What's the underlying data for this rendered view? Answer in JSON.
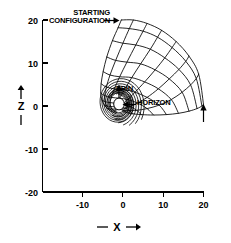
{
  "figure": {
    "annotations": {
      "starting_configuration_line1": "STARTING",
      "starting_configuration_line2": "CONFIGURATION",
      "spin": "SPIN",
      "horizon": "HORIZON"
    },
    "axes": {
      "x_label": "X",
      "z_label": "Z",
      "x_label_prefix": "—",
      "x_label_suffix": "→"
    },
    "colors": {
      "line": "#000000",
      "background": "#ffffff"
    }
  },
  "chart_data": {
    "type": "line",
    "title": "",
    "xlabel": "X",
    "ylabel": "Z",
    "xlim": [
      -18,
      20
    ],
    "ylim": [
      -20,
      20
    ],
    "grid": false,
    "legend": "none",
    "xticks": [
      -10,
      0,
      10,
      20
    ],
    "xticklabels": [
      "-10",
      "0",
      "10",
      "20"
    ],
    "yticks": [
      20,
      10,
      0,
      -10,
      -20
    ],
    "yticklabels": [
      "20",
      "10",
      "0",
      "-10",
      "-20"
    ],
    "horizon": {
      "center_x": -1.0,
      "center_z": 0.6,
      "radius_x": 1.3,
      "radius_z": 1.5
    },
    "spin_arrow": {
      "x": -1.0,
      "z_from": 1.6,
      "z_to": 5.2,
      "direction": "up"
    },
    "right_edge_arrow": {
      "x": 20.0,
      "z_from": -3.6,
      "z_to": 0.4,
      "direction": "up"
    },
    "starting_configuration_arrow": {
      "to_x": -0.4,
      "to_z": 20.0
    },
    "horizon_arrow": {
      "to_x": 0.6,
      "to_z": 0.4
    },
    "series": [
      {
        "name": "radial-spiral-1",
        "role": "mesh-radial",
        "x": [
          -0.4,
          -1.2,
          -2.6,
          -4.0,
          -4.9,
          -5.4,
          -5.5,
          -5.2,
          -4.6,
          -3.8,
          -3.0,
          -2.3,
          -1.8,
          -1.5
        ],
        "z": [
          20.0,
          18.2,
          15.2,
          11.4,
          8.0,
          5.2,
          3.0,
          1.4,
          0.2,
          -0.6,
          -1.2,
          -1.5,
          -1.6,
          -1.4
        ]
      },
      {
        "name": "radial-spiral-2",
        "role": "mesh-radial",
        "x": [
          2.6,
          1.6,
          0.0,
          -1.8,
          -3.2,
          -4.1,
          -4.5,
          -4.4,
          -4.0,
          -3.3,
          -2.6,
          -2.0,
          -1.7
        ],
        "z": [
          20.0,
          18.0,
          14.6,
          10.6,
          7.2,
          4.4,
          2.4,
          1.0,
          0.0,
          -0.7,
          -1.1,
          -1.3,
          -1.3
        ]
      },
      {
        "name": "radial-spiral-3",
        "role": "mesh-radial",
        "x": [
          6.0,
          5.0,
          3.2,
          1.0,
          -0.8,
          -2.1,
          -2.9,
          -3.2,
          -3.1,
          -2.7,
          -2.2,
          -1.8
        ],
        "z": [
          19.2,
          17.4,
          14.2,
          10.2,
          6.8,
          4.0,
          2.0,
          0.8,
          -0.1,
          -0.7,
          -1.0,
          -1.1
        ]
      },
      {
        "name": "radial-spiral-4",
        "role": "mesh-radial",
        "x": [
          9.6,
          8.6,
          6.8,
          4.4,
          2.2,
          0.4,
          -0.8,
          -1.6,
          -1.9,
          -1.9,
          -1.7,
          -1.5
        ],
        "z": [
          17.6,
          16.0,
          13.2,
          9.8,
          6.6,
          3.8,
          1.8,
          0.6,
          -0.2,
          -0.7,
          -0.9,
          -0.9
        ]
      },
      {
        "name": "radial-spiral-5",
        "role": "mesh-radial",
        "x": [
          13.2,
          12.2,
          10.4,
          8.0,
          5.4,
          3.0,
          1.2,
          0.0,
          -0.7,
          -1.0,
          -1.1
        ],
        "z": [
          15.0,
          13.6,
          11.2,
          8.4,
          5.6,
          3.2,
          1.5,
          0.4,
          -0.3,
          -0.6,
          -0.7
        ]
      },
      {
        "name": "radial-spiral-6",
        "role": "mesh-radial",
        "x": [
          16.4,
          15.6,
          13.9,
          11.5,
          8.8,
          6.0,
          3.6,
          1.8,
          0.6,
          -0.1,
          -0.5
        ],
        "z": [
          11.6,
          10.4,
          8.5,
          6.3,
          4.0,
          2.0,
          0.7,
          -0.1,
          -0.5,
          -0.7,
          -0.7
        ]
      },
      {
        "name": "radial-spiral-7",
        "role": "mesh-radial",
        "x": [
          18.8,
          18.2,
          16.8,
          14.7,
          12.0,
          9.0,
          6.0,
          3.4,
          1.6,
          0.4,
          -0.2
        ],
        "z": [
          7.4,
          6.4,
          4.9,
          3.2,
          1.5,
          0.2,
          -0.6,
          -1.0,
          -1.1,
          -1.1,
          -1.0
        ]
      },
      {
        "name": "radial-spiral-8",
        "role": "mesh-radial",
        "x": [
          20.0,
          19.6,
          18.4,
          16.4,
          13.8,
          10.8,
          7.6,
          4.6,
          2.4,
          0.9,
          0.0
        ],
        "z": [
          0.4,
          0.0,
          -0.6,
          -1.2,
          -1.7,
          -2.0,
          -2.1,
          -2.0,
          -1.8,
          -1.5,
          -1.3
        ]
      },
      {
        "name": "transverse-arc-outer",
        "role": "mesh-transverse",
        "x": [
          -0.4,
          2.6,
          6.0,
          9.6,
          13.2,
          16.4,
          18.8,
          20.0
        ],
        "z": [
          20.0,
          20.0,
          19.2,
          17.6,
          15.0,
          11.6,
          7.4,
          0.4
        ]
      },
      {
        "name": "transverse-arc-1",
        "role": "mesh-transverse",
        "x": [
          -1.2,
          1.6,
          5.0,
          8.6,
          12.2,
          15.6,
          18.2,
          19.6
        ],
        "z": [
          18.2,
          18.0,
          17.4,
          16.0,
          13.6,
          10.4,
          6.4,
          0.0
        ]
      },
      {
        "name": "transverse-arc-2",
        "role": "mesh-transverse",
        "x": [
          -2.6,
          0.0,
          3.2,
          6.8,
          10.4,
          13.9,
          16.8,
          18.4
        ],
        "z": [
          15.2,
          14.6,
          14.2,
          13.2,
          11.2,
          8.5,
          4.9,
          -0.6
        ]
      },
      {
        "name": "transverse-arc-3",
        "role": "mesh-transverse",
        "x": [
          -4.0,
          -1.8,
          1.0,
          4.4,
          8.0,
          11.5,
          14.7,
          16.4
        ],
        "z": [
          11.4,
          10.6,
          10.2,
          9.8,
          8.4,
          6.3,
          3.2,
          -1.2
        ]
      },
      {
        "name": "transverse-arc-4",
        "role": "mesh-transverse",
        "x": [
          -4.9,
          -3.2,
          -0.8,
          2.2,
          5.4,
          8.8,
          12.0,
          13.8
        ],
        "z": [
          8.0,
          7.2,
          6.8,
          6.6,
          5.6,
          4.0,
          1.5,
          -1.7
        ]
      },
      {
        "name": "transverse-arc-5",
        "role": "mesh-transverse",
        "x": [
          -5.4,
          -4.1,
          -2.1,
          0.4,
          3.0,
          6.0,
          9.0,
          10.8
        ],
        "z": [
          5.2,
          4.4,
          4.0,
          3.8,
          3.2,
          2.0,
          0.2,
          -2.0
        ]
      },
      {
        "name": "transverse-arc-6",
        "role": "mesh-transverse",
        "x": [
          -5.5,
          -4.5,
          -2.9,
          -0.8,
          1.2,
          3.6,
          6.0,
          7.6
        ],
        "z": [
          3.0,
          2.4,
          2.0,
          1.8,
          1.5,
          0.7,
          -0.6,
          -2.1
        ]
      },
      {
        "name": "transverse-arc-7",
        "role": "mesh-transverse",
        "x": [
          -5.2,
          -4.4,
          -3.2,
          -1.6,
          0.0,
          1.8,
          3.4,
          4.6
        ],
        "z": [
          1.4,
          1.0,
          0.8,
          0.6,
          0.4,
          -0.1,
          -1.0,
          -2.0
        ]
      },
      {
        "name": "transverse-arc-8",
        "role": "mesh-transverse",
        "x": [
          -4.6,
          -4.0,
          -3.1,
          -1.9,
          -0.7,
          0.6,
          1.6,
          2.4
        ],
        "z": [
          0.2,
          0.0,
          -0.1,
          -0.2,
          -0.3,
          -0.5,
          -1.1,
          -1.8
        ]
      },
      {
        "name": "transverse-arc-9",
        "role": "mesh-transverse",
        "x": [
          -3.8,
          -3.3,
          -2.7,
          -1.9,
          -1.0,
          -0.1,
          0.4,
          0.9
        ],
        "z": [
          -0.6,
          -0.7,
          -0.7,
          -0.7,
          -0.6,
          -0.7,
          -1.1,
          -1.5
        ]
      }
    ]
  }
}
